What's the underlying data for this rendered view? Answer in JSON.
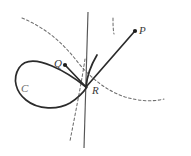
{
  "figure": {
    "kind": "geometric-curve-diagram",
    "background_color": "#ffffff",
    "width": 191,
    "height": 156,
    "labels": {
      "point_p": "P",
      "point_q": "Q",
      "point_r": "R",
      "curve_c": "C"
    },
    "colors": {
      "curve_stroke": "#2b2b2b",
      "dashed_stroke": "#6f6f6f",
      "axis_stroke": "#555555",
      "label_text": "#3a3a3a",
      "faint_label_text": "#6a6a6a"
    },
    "geometry": {
      "node_point_r": [
        86,
        87
      ],
      "point_p": [
        135,
        31
      ],
      "point_q_dot": [
        65,
        65
      ],
      "loop_extent": [
        14,
        26,
        100,
        104
      ],
      "vertical_line": [
        88,
        12,
        84,
        148
      ]
    },
    "paths": {
      "loop_curve_c": "M 86 87 C 74 76 62 68 48 63 C 33 58 20 32 17 48 C 13 66 16 84 28 95 C 40 106 58 108 70 101 C 80 95 85 92 91 84",
      "node_upper_branch": "M 86 87 C 88 76 94 66 101 58",
      "secant_q_to_r": "M 65 65 L 86 87",
      "ray_r_to_p": "M 86 87 L 134 32",
      "dashed_curve": "M 22 18 C 44 28 64 44 78 62 C 92 80 108 92 126 97 C 140 101 152 102 163 100",
      "dashed_lower_tangent": "M 82 66 L 69 140",
      "vertical_axis": "M 88 12 L 84 148"
    }
  }
}
